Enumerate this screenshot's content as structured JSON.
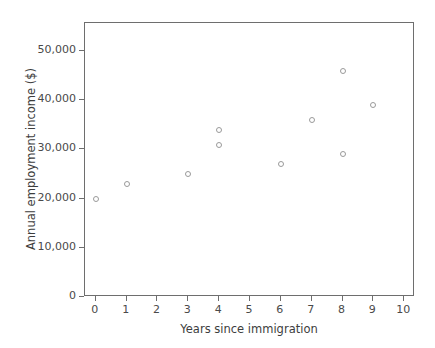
{
  "chart_data": {
    "type": "scatter",
    "title": "",
    "xlabel": "Years since immigration",
    "ylabel": "Annual employment income ($)",
    "xlim": [
      -0.35,
      10.35
    ],
    "ylim": [
      0,
      55700
    ],
    "grid": false,
    "legend": null,
    "marker": "open-circle",
    "marker_color": "#9a9a9a",
    "x_ticks": [
      0,
      1,
      2,
      3,
      4,
      5,
      6,
      7,
      8,
      9,
      10
    ],
    "x_tick_labels": [
      "0",
      "1",
      "2",
      "3",
      "4",
      "5",
      "6",
      "7",
      "8",
      "9",
      "10"
    ],
    "y_ticks": [
      0,
      10000,
      20000,
      30000,
      40000,
      50000
    ],
    "y_tick_labels": [
      "0",
      "10,000",
      "20,000",
      "30,000",
      "40,000",
      "50,000"
    ],
    "points": [
      {
        "x": 0,
        "y": 20000
      },
      {
        "x": 1,
        "y": 23000
      },
      {
        "x": 3,
        "y": 25000
      },
      {
        "x": 4,
        "y": 34000
      },
      {
        "x": 4,
        "y": 31000
      },
      {
        "x": 6,
        "y": 27000
      },
      {
        "x": 7,
        "y": 36000
      },
      {
        "x": 8,
        "y": 46000
      },
      {
        "x": 8,
        "y": 29000
      },
      {
        "x": 9,
        "y": 39000
      }
    ]
  }
}
